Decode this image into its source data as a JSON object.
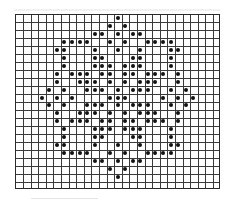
{
  "chart": {
    "type": "stitch-pattern-grid",
    "columns": 27,
    "rows": 22,
    "colors": {
      "background": "#ffffff",
      "grid_line": "#3a3a3a",
      "dot": "#111111"
    },
    "filled_cells_by_row": [
      {
        "row": 0,
        "cols": [
          13
        ]
      },
      {
        "row": 1,
        "cols": [
          12,
          14
        ]
      },
      {
        "row": 2,
        "cols": [
          10,
          11,
          13,
          15,
          16
        ]
      },
      {
        "row": 3,
        "cols": [
          6,
          7,
          8,
          9,
          12,
          14,
          17,
          18,
          19,
          20
        ]
      },
      {
        "row": 4,
        "cols": [
          5,
          6,
          10,
          13,
          16,
          20,
          21
        ]
      },
      {
        "row": 5,
        "cols": [
          6,
          10,
          11,
          15,
          16,
          20
        ]
      },
      {
        "row": 6,
        "cols": [
          6,
          10,
          11,
          12,
          14,
          15,
          16,
          20
        ]
      },
      {
        "row": 7,
        "cols": [
          5,
          7,
          8,
          9,
          11,
          12,
          14,
          15,
          17,
          18,
          19,
          21
        ]
      },
      {
        "row": 8,
        "cols": [
          5,
          8,
          9,
          10,
          12,
          14,
          16,
          17,
          18,
          21
        ]
      },
      {
        "row": 9,
        "cols": [
          4,
          6,
          9,
          10,
          11,
          13,
          15,
          16,
          17,
          20,
          22
        ]
      },
      {
        "row": 10,
        "cols": [
          3,
          5,
          7,
          12,
          13,
          14,
          19,
          21,
          23
        ]
      },
      {
        "row": 11,
        "cols": [
          4,
          6,
          9,
          10,
          11,
          13,
          15,
          16,
          17,
          20,
          22
        ]
      },
      {
        "row": 12,
        "cols": [
          5,
          8,
          9,
          10,
          12,
          14,
          16,
          17,
          18,
          21
        ]
      },
      {
        "row": 13,
        "cols": [
          5,
          7,
          8,
          9,
          11,
          12,
          14,
          15,
          17,
          18,
          19,
          21
        ]
      },
      {
        "row": 14,
        "cols": [
          6,
          10,
          11,
          12,
          14,
          15,
          16,
          20
        ]
      },
      {
        "row": 15,
        "cols": [
          6,
          10,
          11,
          15,
          16,
          20
        ]
      },
      {
        "row": 16,
        "cols": [
          5,
          6,
          10,
          13,
          16,
          20,
          21
        ]
      },
      {
        "row": 17,
        "cols": [
          6,
          7,
          8,
          9,
          12,
          14,
          17,
          18,
          19,
          20
        ]
      },
      {
        "row": 18,
        "cols": [
          10,
          11,
          13,
          15,
          16
        ]
      },
      {
        "row": 19,
        "cols": [
          12,
          14
        ]
      },
      {
        "row": 20,
        "cols": [
          13
        ]
      }
    ]
  }
}
